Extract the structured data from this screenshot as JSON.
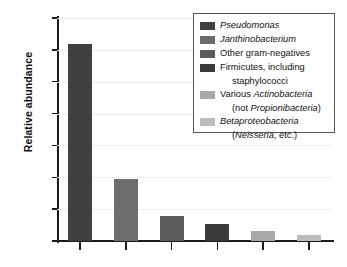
{
  "chart_data": {
    "type": "bar",
    "title": "",
    "xlabel": "",
    "ylabel": "Relative abundance",
    "ylim": [
      0,
      70
    ],
    "ytick_values": [
      0,
      10,
      20,
      30,
      40,
      50,
      60,
      70
    ],
    "ytick_labels": [
      "0",
      "10",
      "20",
      "30",
      "40",
      "50",
      "60",
      "70"
    ],
    "grid": true,
    "legend_position": "top-right",
    "categories": [
      "Pseudomonas",
      "Janthinobacterium",
      "Other gram-negatives",
      "Firmicutes, including staphylococci",
      "Various Actinobacteria (not Propionibacteria)",
      "Betaproteobacteria (Neisseria, etc.)"
    ],
    "values": [
      62.0,
      19.5,
      7.7,
      5.4,
      3.1,
      2.0
    ],
    "colors": [
      "#404040",
      "#6d6d6d",
      "#5c5c5c",
      "#3a3a3a",
      "#a9a9a9",
      "#bcbcbc"
    ]
  },
  "legend": {
    "entries": [
      {
        "color": "#404040",
        "line1": "Pseudomonas",
        "line1_italic": true,
        "line2": ""
      },
      {
        "color": "#6d6d6d",
        "line1": "Janthinobacterium",
        "line1_italic": true,
        "line2": ""
      },
      {
        "color": "#5c5c5c",
        "line1": "Other gram-negatives",
        "line1_italic": false,
        "line2": ""
      },
      {
        "color": "#3a3a3a",
        "line1": "Firmicutes, including",
        "line1_italic": false,
        "line2": "staphylococci"
      },
      {
        "color": "#a9a9a9",
        "line1": "Various Actinobacteria",
        "line1_italic": false,
        "line2": "(not Propionibacteria)"
      },
      {
        "color": "#bcbcbc",
        "line1": "Betaproteobacteria",
        "line1_italic": true,
        "line2": "(Neisseria, etc.)"
      }
    ]
  },
  "axis": {
    "y_title": "Relative abundance"
  }
}
